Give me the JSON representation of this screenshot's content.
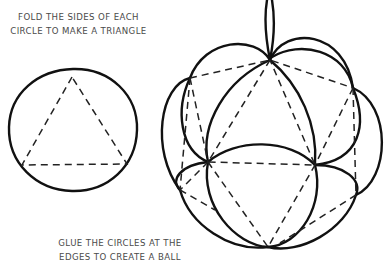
{
  "captions": {
    "step1_line1": "FOLD THE SIDES OF EACH",
    "step1_line2": "CIRCLE TO MAKE A TRIANGLE",
    "step2_line1": "GLUE THE CIRCLES AT THE",
    "step2_line2": "EDGES TO CREATE A BALL"
  },
  "illustrations": {
    "left": "circle-with-dashed-triangle",
    "right": "paper-circle-ball-ornament-with-hanging-loop"
  },
  "colors": {
    "line": "#111111",
    "text": "#4a4a4a",
    "background": "#ffffff"
  }
}
